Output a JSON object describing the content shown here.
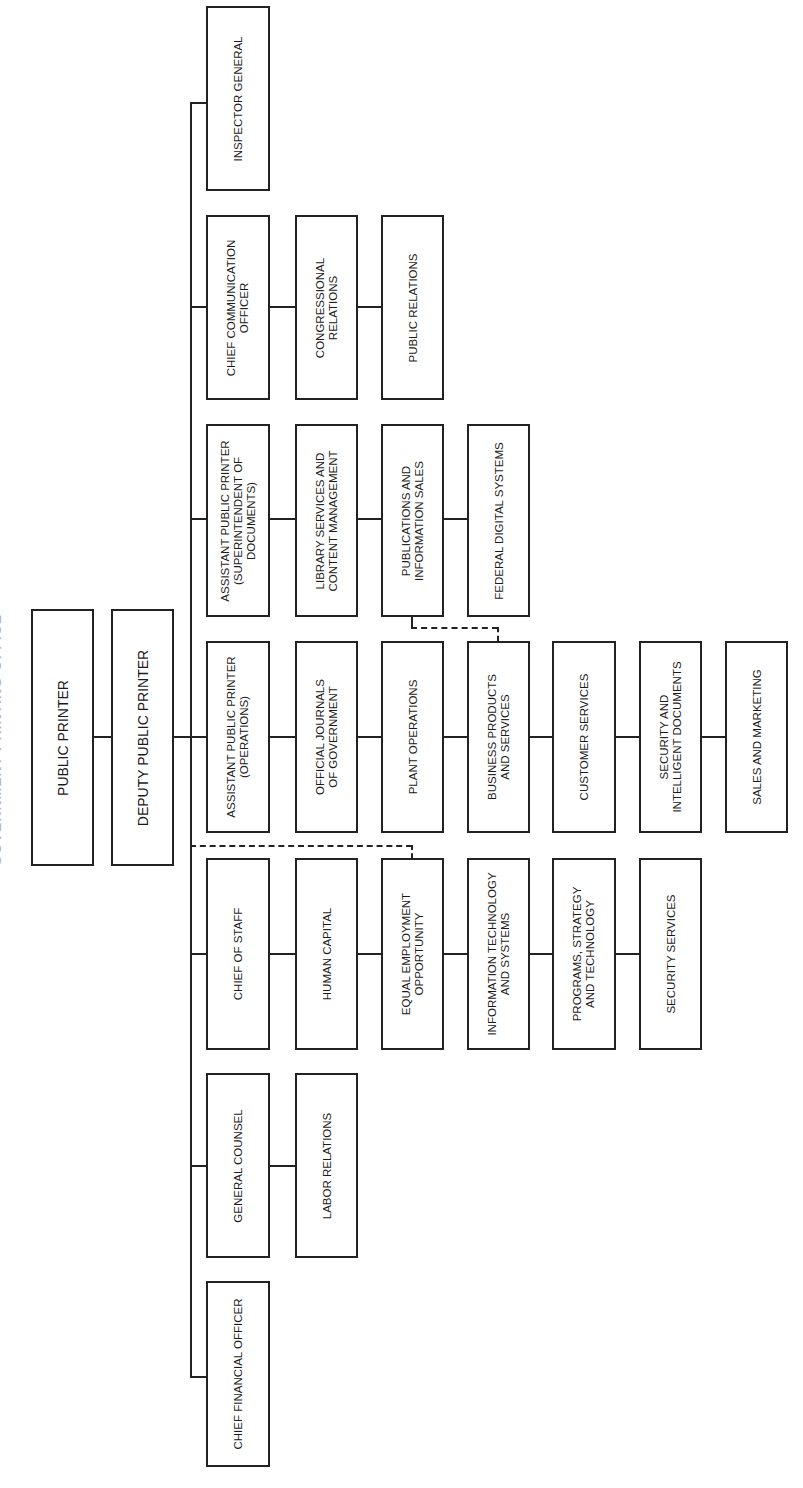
{
  "chart": {
    "title": "GOVERNMENT PRINTING OFFICE",
    "orientation": "rotated 90deg counter-clockwise",
    "top": {
      "public_printer": "PUBLIC PRINTER",
      "deputy_public_printer": "DEPUTY PUBLIC PRINTER"
    },
    "branches": [
      {
        "head": "INSPECTOR GENERAL",
        "units": []
      },
      {
        "head": "CHIEF COMMUNICATION\nOFFICER",
        "units": [
          "CONGRESSIONAL\nRELATIONS",
          "PUBLIC RELATIONS"
        ]
      },
      {
        "head": "ASSISTANT PUBLIC PRINTER\n(SUPERINTENDENT OF\nDOCUMENTS)",
        "units": [
          "LIBRARY SERVICES AND\nCONTENT MANAGEMENT",
          "PUBLICATIONS AND\nINFORMATION SALES",
          "FEDERAL DIGITAL SYSTEMS"
        ]
      },
      {
        "head": "ASSISTANT PUBLIC PRINTER\n(OPERATIONS)",
        "units": [
          "OFFICIAL JOURNALS\nOF GOVERNMENT",
          "PLANT OPERATIONS",
          "BUSINESS PRODUCTS\nAND SERVICES",
          "CUSTOMER SERVICES",
          "SECURITY AND\nINTELLIGENT DOCUMENTS",
          "SALES AND MARKETING"
        ]
      },
      {
        "head": "CHIEF OF STAFF",
        "units": [
          "HUMAN CAPITAL",
          "EQUAL EMPLOYMENT\nOPPORTUNITY",
          "INFORMATION TECHNOLOGY\nAND SYSTEMS",
          "PROGRAMS, STRATEGY\nAND TECHNOLOGY",
          "SECURITY SERVICES"
        ]
      },
      {
        "head": "GENERAL COUNSEL",
        "units": [
          "LABOR RELATIONS"
        ]
      },
      {
        "head": "CHIEF FINANCIAL OFFICER",
        "units": []
      }
    ],
    "dotted_links": [
      {
        "from": "DEPUTY PUBLIC PRINTER",
        "to": "EQUAL EMPLOYMENT OPPORTUNITY"
      },
      {
        "from": "PUBLICATIONS AND INFORMATION SALES",
        "to": "BUSINESS PRODUCTS AND SERVICES"
      }
    ]
  }
}
